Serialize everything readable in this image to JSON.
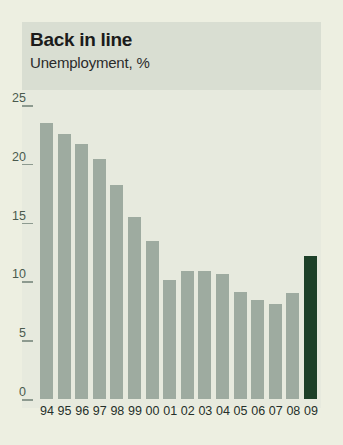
{
  "chart_data": {
    "type": "bar",
    "title": "Back in line",
    "subtitle": "Unemployment, %",
    "xlabel": "",
    "ylabel": "",
    "ylim": [
      0,
      25
    ],
    "yticks": [
      0,
      5,
      10,
      15,
      20,
      25
    ],
    "grid": false,
    "legend": "none",
    "categories": [
      "94",
      "95",
      "96",
      "97",
      "98",
      "99",
      "00",
      "01",
      "02",
      "03",
      "04",
      "05",
      "06",
      "07",
      "08",
      "09"
    ],
    "values": [
      23.5,
      22.5,
      21.7,
      20.4,
      18.2,
      15.5,
      13.4,
      10.1,
      10.9,
      10.9,
      10.6,
      9.1,
      8.4,
      8.1,
      9.0,
      12.2
    ],
    "series": [
      {
        "name": "Unemployment, %",
        "values": [
          23.5,
          22.5,
          21.7,
          20.4,
          18.2,
          15.5,
          13.4,
          10.1,
          10.9,
          10.9,
          10.6,
          9.1,
          8.4,
          8.1,
          9.0,
          12.2
        ]
      }
    ],
    "highlight_category": "09",
    "colors": {
      "bar": "#9eaba0",
      "bar_highlight": "#1d4028",
      "page_background": "#edefe1",
      "header_band": "#d9ded2",
      "plot_background": "#e7eade",
      "tick": "#8d9a8f",
      "tick_label": "#4a5a4e",
      "title_text": "#1b1b1b"
    }
  }
}
